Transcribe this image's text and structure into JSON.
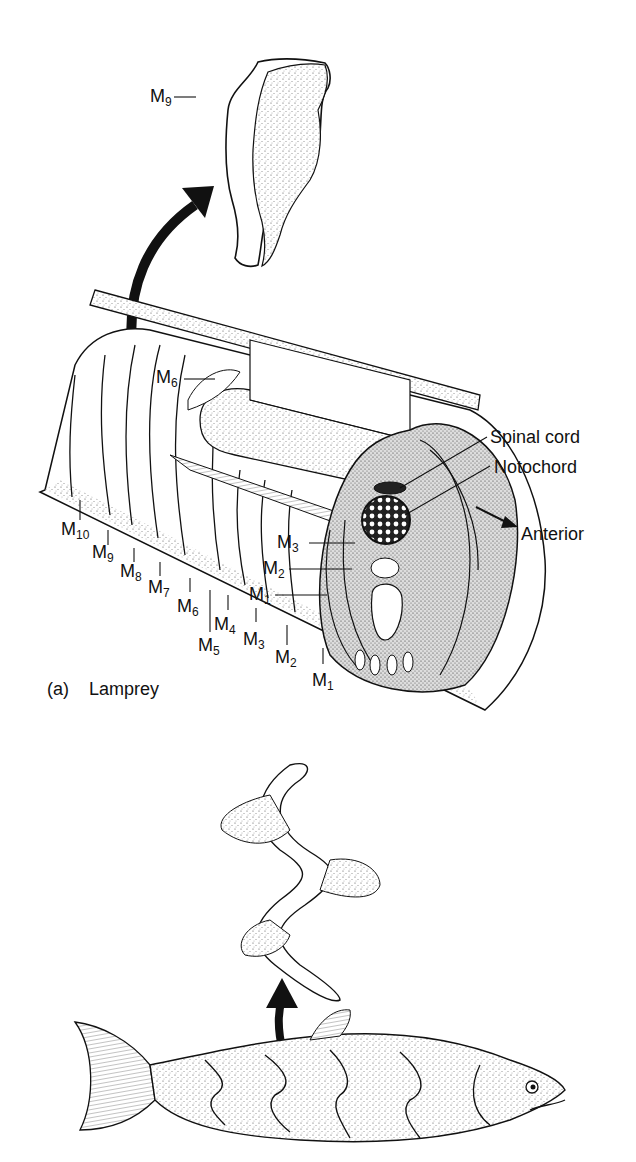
{
  "panel_a": {
    "caption_letter": "(a)",
    "caption_name": "Lamprey",
    "isolated_myomere": {
      "label_main": "M",
      "label_sub": "9"
    },
    "upper_label": {
      "main": "M",
      "sub": "6"
    },
    "structures": {
      "spinal_cord": "Spinal cord",
      "notochord": "Notochord",
      "direction": "Anterior"
    },
    "outer_myomeres": [
      {
        "main": "M",
        "sub": "10"
      },
      {
        "main": "M",
        "sub": "9"
      },
      {
        "main": "M",
        "sub": "8"
      },
      {
        "main": "M",
        "sub": "7"
      },
      {
        "main": "M",
        "sub": "6"
      },
      {
        "main": "M",
        "sub": "5"
      },
      {
        "main": "M",
        "sub": "4"
      },
      {
        "main": "M",
        "sub": "3"
      },
      {
        "main": "M",
        "sub": "2"
      },
      {
        "main": "M",
        "sub": "1"
      }
    ],
    "inner_myomeres": [
      {
        "main": "M",
        "sub": "3"
      },
      {
        "main": "M",
        "sub": "2"
      },
      {
        "main": "M",
        "sub": "1"
      }
    ]
  },
  "panel_b": {
    "subject": "bony fish with W-shaped myomere removed"
  },
  "colors": {
    "ink": "#111111",
    "stipple": "#bdbdbd",
    "background": "#ffffff"
  }
}
